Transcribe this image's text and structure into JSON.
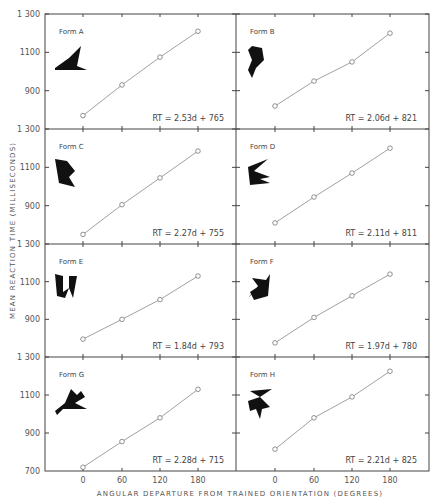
{
  "figure": {
    "ylabel": "MEAN REACTION TIME (MILLISECONDS)",
    "xlabel": "ANGULAR DEPARTURE FROM TRAINED ORIENTATION (DEGREES)",
    "x_ticks": [
      "0",
      "60",
      "120",
      "180"
    ],
    "y_ticks": [
      "1300",
      "1100",
      "900",
      "700"
    ]
  },
  "chart_data": [
    {
      "type": "line",
      "title": "Form A",
      "equation": "RT = 2.53d + 765",
      "x": [
        0,
        60,
        120,
        180
      ],
      "values": [
        770,
        930,
        1075,
        1210
      ],
      "xlabel": "Angular departure (degrees)",
      "ylabel": "Mean reaction time (ms)",
      "ylim": [
        700,
        1300
      ]
    },
    {
      "type": "line",
      "title": "Form B",
      "equation": "RT = 2.06d + 821",
      "x": [
        0,
        60,
        120,
        180
      ],
      "values": [
        820,
        950,
        1050,
        1200
      ],
      "xlabel": "Angular departure (degrees)",
      "ylabel": "Mean reaction time (ms)",
      "ylim": [
        700,
        1300
      ]
    },
    {
      "type": "line",
      "title": "Form C",
      "equation": "RT = 2.27d + 755",
      "x": [
        0,
        60,
        120,
        180
      ],
      "values": [
        750,
        905,
        1045,
        1185
      ],
      "xlabel": "Angular departure (degrees)",
      "ylabel": "Mean reaction time (ms)",
      "ylim": [
        700,
        1300
      ]
    },
    {
      "type": "line",
      "title": "Form D",
      "equation": "RT = 2.11d + 811",
      "x": [
        0,
        60,
        120,
        180
      ],
      "values": [
        810,
        945,
        1070,
        1200
      ],
      "xlabel": "Angular departure (degrees)",
      "ylabel": "Mean reaction time (ms)",
      "ylim": [
        700,
        1300
      ]
    },
    {
      "type": "line",
      "title": "Form E",
      "equation": "RT = 1.84d + 793",
      "x": [
        0,
        60,
        120,
        180
      ],
      "values": [
        795,
        900,
        1005,
        1130
      ],
      "xlabel": "Angular departure (degrees)",
      "ylabel": "Mean reaction time (ms)",
      "ylim": [
        700,
        1300
      ]
    },
    {
      "type": "line",
      "title": "Form F",
      "equation": "RT = 1.97d + 780",
      "x": [
        0,
        60,
        120,
        180
      ],
      "values": [
        775,
        910,
        1025,
        1140
      ],
      "xlabel": "Angular departure (degrees)",
      "ylabel": "Mean reaction time (ms)",
      "ylim": [
        700,
        1300
      ]
    },
    {
      "type": "line",
      "title": "Form G",
      "equation": "RT = 2.28d + 715",
      "x": [
        0,
        60,
        120,
        180
      ],
      "values": [
        720,
        855,
        980,
        1130
      ],
      "xlabel": "Angular departure (degrees)",
      "ylabel": "Mean reaction time (ms)",
      "ylim": [
        700,
        1300
      ]
    },
    {
      "type": "line",
      "title": "Form H",
      "equation": "RT = 2.21d + 825",
      "x": [
        0,
        60,
        120,
        180
      ],
      "values": [
        815,
        980,
        1090,
        1225
      ],
      "xlabel": "Angular departure (degrees)",
      "ylabel": "Mean reaction time (ms)",
      "ylim": [
        700,
        1300
      ]
    }
  ]
}
